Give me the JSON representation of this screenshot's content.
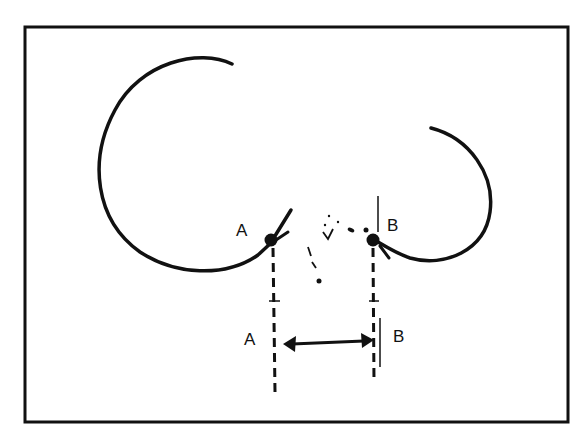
{
  "figure": {
    "colors": {
      "stroke": "#111111",
      "background": "#ffffff"
    },
    "points": {
      "A_top": {
        "label": "A"
      },
      "B_top": {
        "label": "B"
      },
      "A_bottom": {
        "label": "A"
      },
      "B_bottom": {
        "label": "B"
      }
    },
    "annotations": {
      "middle_mark": "i"
    }
  }
}
